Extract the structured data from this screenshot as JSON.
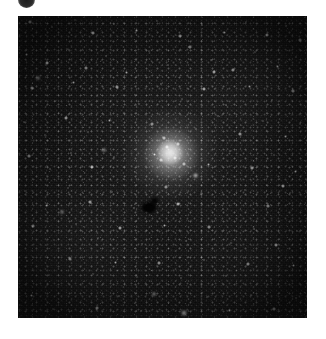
{
  "page": {
    "background_color": "#ffffff",
    "width": 326,
    "height": 339
  },
  "corner_marker": {
    "icon": "filled-circle-icon",
    "color": "#1d1d1d",
    "description": "partially cropped dark circular marker at top-left edge"
  },
  "image": {
    "name": "globular-cluster-plate",
    "left": 18,
    "top": 16,
    "width": 289,
    "height": 302,
    "background_color": "#0d0d0d",
    "caption": ""
  },
  "features": {
    "cluster": {
      "label": "globular-cluster",
      "center_x": 152,
      "center_y": 137,
      "core_color": "#ffffff",
      "halo_color": "#c8c8c8"
    },
    "dark_blob": {
      "label": "dark-occulting-spot",
      "center_x": 131,
      "center_y": 191,
      "color": "#030303"
    }
  },
  "stars": [
    {
      "x": 12,
      "y": 6,
      "r": 1.6,
      "b": 0.7
    },
    {
      "x": 34,
      "y": 11,
      "r": 1.4,
      "b": 0.62
    },
    {
      "x": 57,
      "y": 4,
      "r": 1.2,
      "b": 0.55
    },
    {
      "x": 75,
      "y": 17,
      "r": 2.1,
      "b": 0.85
    },
    {
      "x": 96,
      "y": 8,
      "r": 1.3,
      "b": 0.58
    },
    {
      "x": 118,
      "y": 14,
      "r": 1.5,
      "b": 0.66
    },
    {
      "x": 139,
      "y": 5,
      "r": 1.1,
      "b": 0.5
    },
    {
      "x": 162,
      "y": 20,
      "r": 1.8,
      "b": 0.74
    },
    {
      "x": 184,
      "y": 9,
      "r": 1.3,
      "b": 0.6
    },
    {
      "x": 206,
      "y": 16,
      "r": 1.5,
      "b": 0.64
    },
    {
      "x": 228,
      "y": 6,
      "r": 1.2,
      "b": 0.54
    },
    {
      "x": 249,
      "y": 19,
      "r": 2.0,
      "b": 0.8
    },
    {
      "x": 268,
      "y": 10,
      "r": 1.4,
      "b": 0.62
    },
    {
      "x": 282,
      "y": 24,
      "r": 1.6,
      "b": 0.68
    },
    {
      "x": 8,
      "y": 38,
      "r": 1.5,
      "b": 0.64
    },
    {
      "x": 29,
      "y": 47,
      "r": 2.2,
      "b": 0.88
    },
    {
      "x": 49,
      "y": 33,
      "r": 1.2,
      "b": 0.52
    },
    {
      "x": 68,
      "y": 52,
      "r": 1.7,
      "b": 0.72
    },
    {
      "x": 88,
      "y": 40,
      "r": 1.3,
      "b": 0.56
    },
    {
      "x": 108,
      "y": 56,
      "r": 1.5,
      "b": 0.63
    },
    {
      "x": 131,
      "y": 35,
      "r": 1.1,
      "b": 0.48
    },
    {
      "x": 150,
      "y": 49,
      "r": 1.4,
      "b": 0.6
    },
    {
      "x": 172,
      "y": 31,
      "r": 1.6,
      "b": 0.68
    },
    {
      "x": 193,
      "y": 44,
      "r": 1.2,
      "b": 0.52
    },
    {
      "x": 215,
      "y": 54,
      "r": 1.9,
      "b": 0.78
    },
    {
      "x": 237,
      "y": 36,
      "r": 1.3,
      "b": 0.57
    },
    {
      "x": 259,
      "y": 50,
      "r": 1.5,
      "b": 0.65
    },
    {
      "x": 278,
      "y": 41,
      "r": 1.2,
      "b": 0.53
    },
    {
      "x": 14,
      "y": 72,
      "r": 1.8,
      "b": 0.74
    },
    {
      "x": 37,
      "y": 85,
      "r": 1.3,
      "b": 0.56
    },
    {
      "x": 55,
      "y": 66,
      "r": 1.5,
      "b": 0.64
    },
    {
      "x": 79,
      "y": 80,
      "r": 1.1,
      "b": 0.48
    },
    {
      "x": 99,
      "y": 71,
      "r": 1.7,
      "b": 0.71
    },
    {
      "x": 121,
      "y": 88,
      "r": 1.3,
      "b": 0.57
    },
    {
      "x": 143,
      "y": 68,
      "r": 1.4,
      "b": 0.61
    },
    {
      "x": 164,
      "y": 83,
      "r": 1.2,
      "b": 0.51
    },
    {
      "x": 186,
      "y": 73,
      "r": 2.0,
      "b": 0.82
    },
    {
      "x": 208,
      "y": 89,
      "r": 1.3,
      "b": 0.56
    },
    {
      "x": 231,
      "y": 70,
      "r": 1.5,
      "b": 0.64
    },
    {
      "x": 254,
      "y": 84,
      "r": 1.2,
      "b": 0.52
    },
    {
      "x": 275,
      "y": 75,
      "r": 1.6,
      "b": 0.68
    },
    {
      "x": 6,
      "y": 106,
      "r": 1.4,
      "b": 0.6
    },
    {
      "x": 27,
      "y": 119,
      "r": 1.2,
      "b": 0.52
    },
    {
      "x": 48,
      "y": 102,
      "r": 1.9,
      "b": 0.78
    },
    {
      "x": 70,
      "y": 116,
      "r": 1.3,
      "b": 0.55
    },
    {
      "x": 91,
      "y": 104,
      "r": 1.5,
      "b": 0.63
    },
    {
      "x": 112,
      "y": 121,
      "r": 1.1,
      "b": 0.47
    },
    {
      "x": 134,
      "y": 108,
      "r": 1.6,
      "b": 0.67
    },
    {
      "x": 178,
      "y": 113,
      "r": 1.4,
      "b": 0.6
    },
    {
      "x": 200,
      "y": 100,
      "r": 1.2,
      "b": 0.52
    },
    {
      "x": 222,
      "y": 118,
      "r": 1.7,
      "b": 0.72
    },
    {
      "x": 245,
      "y": 105,
      "r": 1.3,
      "b": 0.56
    },
    {
      "x": 267,
      "y": 120,
      "r": 1.5,
      "b": 0.64
    },
    {
      "x": 282,
      "y": 108,
      "r": 1.2,
      "b": 0.5
    },
    {
      "x": 11,
      "y": 140,
      "r": 1.6,
      "b": 0.68
    },
    {
      "x": 32,
      "y": 153,
      "r": 1.2,
      "b": 0.52
    },
    {
      "x": 53,
      "y": 137,
      "r": 1.4,
      "b": 0.6
    },
    {
      "x": 74,
      "y": 151,
      "r": 2.1,
      "b": 0.85
    },
    {
      "x": 96,
      "y": 141,
      "r": 1.3,
      "b": 0.55
    },
    {
      "x": 117,
      "y": 156,
      "r": 1.1,
      "b": 0.48
    },
    {
      "x": 190,
      "y": 148,
      "r": 1.5,
      "b": 0.63
    },
    {
      "x": 212,
      "y": 135,
      "r": 1.3,
      "b": 0.56
    },
    {
      "x": 234,
      "y": 152,
      "r": 1.7,
      "b": 0.71
    },
    {
      "x": 256,
      "y": 139,
      "r": 1.2,
      "b": 0.51
    },
    {
      "x": 277,
      "y": 155,
      "r": 1.5,
      "b": 0.64
    },
    {
      "x": 7,
      "y": 175,
      "r": 1.3,
      "b": 0.57
    },
    {
      "x": 28,
      "y": 189,
      "r": 1.5,
      "b": 0.64
    },
    {
      "x": 50,
      "y": 172,
      "r": 1.2,
      "b": 0.5
    },
    {
      "x": 72,
      "y": 186,
      "r": 1.8,
      "b": 0.75
    },
    {
      "x": 94,
      "y": 176,
      "r": 1.3,
      "b": 0.56
    },
    {
      "x": 116,
      "y": 192,
      "r": 1.4,
      "b": 0.61
    },
    {
      "x": 148,
      "y": 171,
      "r": 1.6,
      "b": 0.67
    },
    {
      "x": 160,
      "y": 188,
      "r": 2.2,
      "b": 0.88
    },
    {
      "x": 183,
      "y": 178,
      "r": 1.2,
      "b": 0.51
    },
    {
      "x": 205,
      "y": 193,
      "r": 1.4,
      "b": 0.6
    },
    {
      "x": 227,
      "y": 174,
      "r": 1.3,
      "b": 0.55
    },
    {
      "x": 250,
      "y": 190,
      "r": 1.6,
      "b": 0.68
    },
    {
      "x": 272,
      "y": 177,
      "r": 1.2,
      "b": 0.52
    },
    {
      "x": 15,
      "y": 210,
      "r": 1.7,
      "b": 0.72
    },
    {
      "x": 36,
      "y": 224,
      "r": 1.2,
      "b": 0.52
    },
    {
      "x": 58,
      "y": 208,
      "r": 1.4,
      "b": 0.6
    },
    {
      "x": 80,
      "y": 222,
      "r": 1.1,
      "b": 0.47
    },
    {
      "x": 102,
      "y": 212,
      "r": 1.9,
      "b": 0.79
    },
    {
      "x": 124,
      "y": 228,
      "r": 1.3,
      "b": 0.56
    },
    {
      "x": 146,
      "y": 209,
      "r": 1.5,
      "b": 0.64
    },
    {
      "x": 168,
      "y": 225,
      "r": 1.2,
      "b": 0.51
    },
    {
      "x": 191,
      "y": 211,
      "r": 1.6,
      "b": 0.67
    },
    {
      "x": 213,
      "y": 227,
      "r": 1.3,
      "b": 0.56
    },
    {
      "x": 236,
      "y": 213,
      "r": 1.4,
      "b": 0.61
    },
    {
      "x": 258,
      "y": 229,
      "r": 2.0,
      "b": 0.81
    },
    {
      "x": 279,
      "y": 215,
      "r": 1.2,
      "b": 0.52
    },
    {
      "x": 9,
      "y": 245,
      "r": 1.4,
      "b": 0.6
    },
    {
      "x": 31,
      "y": 259,
      "r": 1.2,
      "b": 0.51
    },
    {
      "x": 52,
      "y": 243,
      "r": 1.7,
      "b": 0.72
    },
    {
      "x": 75,
      "y": 258,
      "r": 1.3,
      "b": 0.55
    },
    {
      "x": 97,
      "y": 246,
      "r": 1.5,
      "b": 0.64
    },
    {
      "x": 119,
      "y": 261,
      "r": 1.1,
      "b": 0.47
    },
    {
      "x": 141,
      "y": 247,
      "r": 1.6,
      "b": 0.68
    },
    {
      "x": 163,
      "y": 262,
      "r": 1.3,
      "b": 0.56
    },
    {
      "x": 186,
      "y": 244,
      "r": 1.4,
      "b": 0.61
    },
    {
      "x": 208,
      "y": 260,
      "r": 1.2,
      "b": 0.51
    },
    {
      "x": 230,
      "y": 248,
      "r": 1.8,
      "b": 0.75
    },
    {
      "x": 253,
      "y": 263,
      "r": 1.3,
      "b": 0.56
    },
    {
      "x": 275,
      "y": 249,
      "r": 1.5,
      "b": 0.64
    },
    {
      "x": 13,
      "y": 279,
      "r": 1.5,
      "b": 0.65
    },
    {
      "x": 35,
      "y": 293,
      "r": 1.2,
      "b": 0.51
    },
    {
      "x": 57,
      "y": 277,
      "r": 1.3,
      "b": 0.57
    },
    {
      "x": 79,
      "y": 292,
      "r": 1.6,
      "b": 0.68
    },
    {
      "x": 101,
      "y": 280,
      "r": 1.2,
      "b": 0.5
    },
    {
      "x": 123,
      "y": 295,
      "r": 1.4,
      "b": 0.61
    },
    {
      "x": 136,
      "y": 278,
      "r": 2.4,
      "b": 0.92
    },
    {
      "x": 166,
      "y": 297,
      "r": 2.6,
      "b": 0.95
    },
    {
      "x": 189,
      "y": 281,
      "r": 1.3,
      "b": 0.56
    },
    {
      "x": 211,
      "y": 294,
      "r": 1.5,
      "b": 0.64
    },
    {
      "x": 233,
      "y": 279,
      "r": 1.2,
      "b": 0.51
    },
    {
      "x": 256,
      "y": 293,
      "r": 1.7,
      "b": 0.72
    },
    {
      "x": 278,
      "y": 282,
      "r": 1.3,
      "b": 0.56
    },
    {
      "x": 20,
      "y": 62,
      "r": 2.4,
      "b": 0.9
    },
    {
      "x": 44,
      "y": 196,
      "r": 2.3,
      "b": 0.87
    },
    {
      "x": 196,
      "y": 56,
      "r": 2.2,
      "b": 0.86
    },
    {
      "x": 265,
      "y": 170,
      "r": 2.1,
      "b": 0.83
    },
    {
      "x": 86,
      "y": 134,
      "r": 2.3,
      "b": 0.88
    },
    {
      "x": 177,
      "y": 159,
      "r": 2.5,
      "b": 0.93
    },
    {
      "x": 149,
      "y": 131,
      "r": 2.2,
      "b": 0.9
    },
    {
      "x": 157,
      "y": 142,
      "r": 1.9,
      "b": 0.86
    },
    {
      "x": 143,
      "y": 144,
      "r": 1.8,
      "b": 0.84
    },
    {
      "x": 160,
      "y": 128,
      "r": 1.7,
      "b": 0.82
    },
    {
      "x": 146,
      "y": 122,
      "r": 1.6,
      "b": 0.8
    },
    {
      "x": 136,
      "y": 138,
      "r": 1.5,
      "b": 0.78
    },
    {
      "x": 166,
      "y": 148,
      "r": 1.6,
      "b": 0.79
    }
  ]
}
